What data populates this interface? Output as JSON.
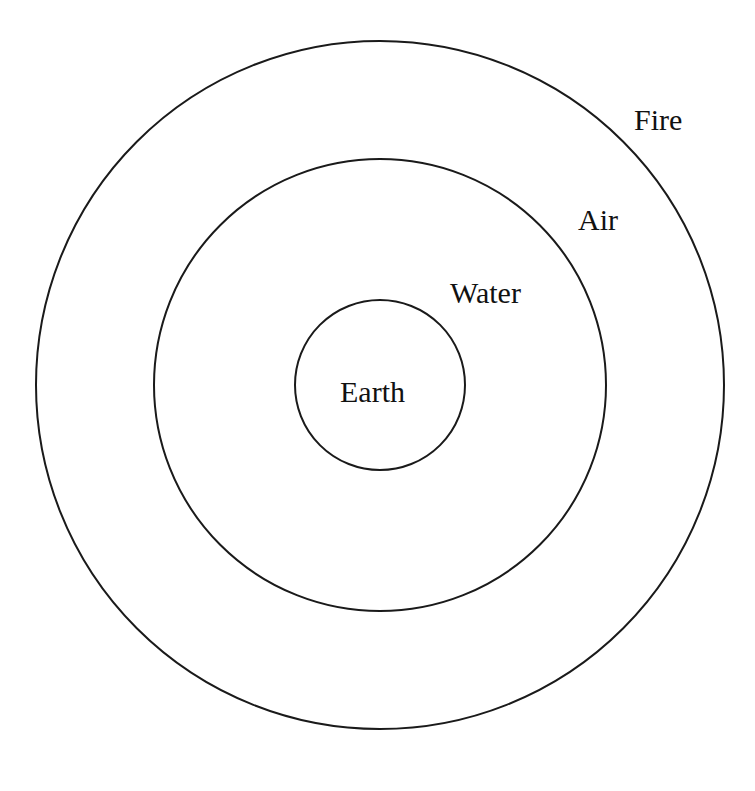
{
  "diagram": {
    "type": "concentric-circles",
    "background_color": "#ffffff",
    "stroke_color": "#1a1a1a",
    "text_color": "#111111",
    "center": {
      "x": 380,
      "y": 385
    },
    "rings": [
      {
        "id": "earth",
        "label": "Earth",
        "order": 1,
        "radius": 85,
        "label_x": 340,
        "label_baseline_y": 402,
        "stroke_width": 2.0
      },
      {
        "id": "water",
        "label": "Water",
        "order": 2,
        "radius": 226,
        "label_x": 450,
        "label_baseline_y": 303,
        "stroke_width": 2.0
      },
      {
        "id": "air",
        "label": "Air",
        "order": 3,
        "radius": 226,
        "label_x": 578,
        "label_baseline_y": 230,
        "stroke_width": 2.0
      },
      {
        "id": "fire",
        "label": "Fire",
        "order": 4,
        "radius": 344,
        "label_x": 634,
        "label_baseline_y": 130,
        "stroke_width": 2.0
      }
    ],
    "drawn_circles": [
      {
        "id": "circle-outer",
        "belongs_to": "fire",
        "radius": 344,
        "stroke_width": 2.0
      },
      {
        "id": "circle-middle",
        "belongs_to": "air",
        "radius": 226,
        "stroke_width": 2.0
      },
      {
        "id": "circle-inner",
        "belongs_to": "earth",
        "radius": 85,
        "stroke_width": 2.0
      }
    ]
  }
}
